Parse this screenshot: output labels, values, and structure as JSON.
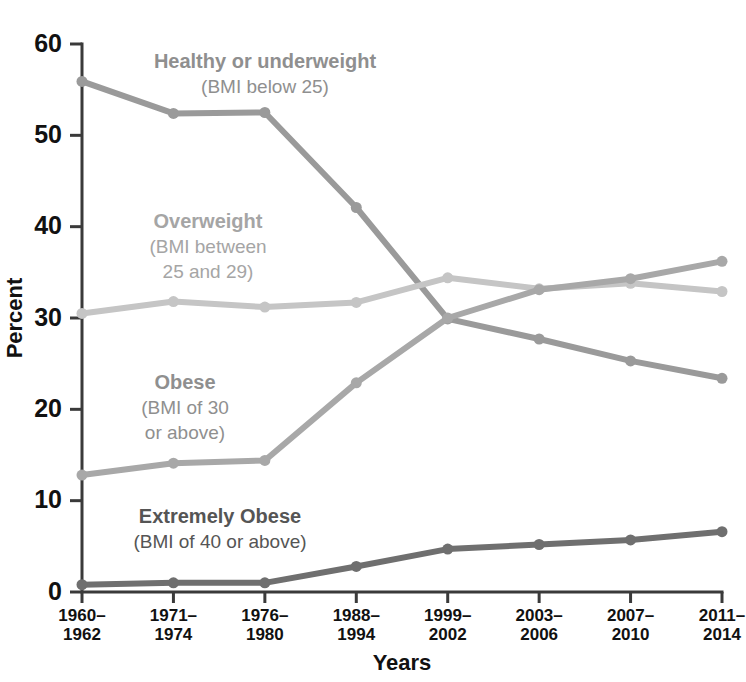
{
  "chart_data": {
    "type": "line",
    "title": "",
    "xlabel": "Years",
    "ylabel": "Percent",
    "ylim": [
      0,
      60
    ],
    "yticks": [
      0,
      10,
      20,
      30,
      40,
      50,
      60
    ],
    "grid": false,
    "legend_position": "inline-annotations",
    "categories": [
      "1960–1962",
      "1971–1974",
      "1976–1980",
      "1988–1994",
      "1999–2002",
      "2003–2006",
      "2007–2010",
      "2011–2014"
    ],
    "series": [
      {
        "name": "Healthy or underweight",
        "sublabel": "(BMI below 25)",
        "color": "#9a9a9a",
        "values": [
          55.9,
          52.4,
          52.5,
          42.1,
          29.9,
          27.7,
          25.3,
          23.4
        ]
      },
      {
        "name": "Overweight",
        "sublabel": "(BMI between 25 and 29)",
        "color": "#c5c5c5",
        "values": [
          30.5,
          31.8,
          31.2,
          31.7,
          34.4,
          33.2,
          33.8,
          32.9
        ]
      },
      {
        "name": "Obese",
        "sublabel": "(BMI of 30 or above)",
        "color": "#a8a8a8",
        "values": [
          12.8,
          14.1,
          14.4,
          22.9,
          30.0,
          33.1,
          34.3,
          36.2
        ]
      },
      {
        "name": "Extremely Obese",
        "sublabel": "(BMI of 40 or above)",
        "color": "#6f6f6f",
        "values": [
          0.8,
          1.0,
          1.0,
          2.8,
          4.7,
          5.2,
          5.7,
          6.6
        ]
      }
    ]
  },
  "annotations": [
    {
      "id": "healthy",
      "line1": "Healthy or underweight",
      "line2": "(BMI below 25)",
      "line3": "",
      "x": 265,
      "y": 68,
      "color": "#8f8f8f"
    },
    {
      "id": "overweight",
      "line1": "Overweight",
      "line2": "(BMI between",
      "line3": "25 and 29)",
      "x": 208,
      "y": 228,
      "color": "#a5a5a5"
    },
    {
      "id": "obese",
      "line1": "Obese",
      "line2": "(BMI of 30",
      "line3": "or above)",
      "x": 185,
      "y": 389,
      "color": "#8f8f8f"
    },
    {
      "id": "extremely-obese",
      "line1": "Extremely Obese",
      "line2": "(BMI of 40 or above)",
      "line3": "",
      "x": 220,
      "y": 523,
      "color": "#555555"
    }
  ],
  "axes": {
    "y_title": "Percent",
    "x_title": "Years"
  }
}
